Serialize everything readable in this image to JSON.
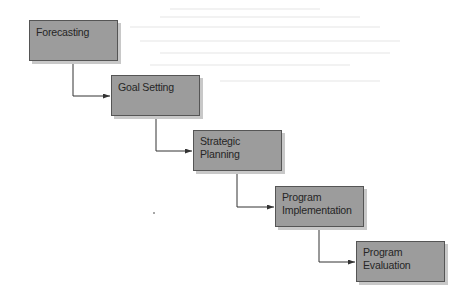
{
  "diagram": {
    "type": "staircase-flow",
    "colors": {
      "box_fill": "#9c9c9c",
      "box_border": "#555555",
      "box_shadow": "#c8c8c8",
      "text": "#262626",
      "connector": "#333333"
    },
    "steps": [
      {
        "id": "forecasting",
        "lines": [
          "Forecasting"
        ]
      },
      {
        "id": "goal-setting",
        "lines": [
          "Goal Setting"
        ]
      },
      {
        "id": "strategic-planning",
        "lines": [
          "Strategic",
          "Planning"
        ]
      },
      {
        "id": "program-implementation",
        "lines": [
          "Program",
          "Implementation"
        ]
      },
      {
        "id": "program-evaluation",
        "lines": [
          "Program",
          "Evaluation"
        ]
      }
    ],
    "connections": [
      {
        "from": "forecasting",
        "to": "goal-setting"
      },
      {
        "from": "goal-setting",
        "to": "strategic-planning"
      },
      {
        "from": "strategic-planning",
        "to": "program-implementation"
      },
      {
        "from": "program-implementation",
        "to": "program-evaluation"
      }
    ]
  }
}
